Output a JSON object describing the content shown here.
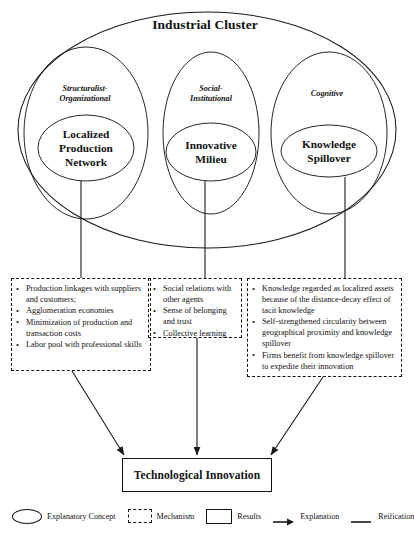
{
  "figure": {
    "cluster_title": "Industrial Cluster"
  },
  "dimensions": [
    {
      "id": "structuralist",
      "label": "Structuralist-\nOrganizational"
    },
    {
      "id": "social",
      "label": "Social-\nInstitutional"
    },
    {
      "id": "cognitive",
      "label": "Cognitive"
    }
  ],
  "concepts": [
    {
      "id": "localized-production-network",
      "label": "Localized\nProduction\nNetwork"
    },
    {
      "id": "innovative-milieu",
      "label": "Innovative\nMilieu"
    },
    {
      "id": "knowledge-spillover",
      "label": "Knowledge\nSpillover"
    }
  ],
  "mechanisms": [
    {
      "id": "structuralist-mechanisms",
      "items": [
        "Production linkages with suppliers and customers;",
        "Agglomeration economies",
        "Minimization of production and transaction costs",
        "Labor pool with professional skills"
      ]
    },
    {
      "id": "social-mechanisms",
      "items": [
        "Social relations with other agents",
        "Sense of belonging and trust",
        "Collective learning"
      ]
    },
    {
      "id": "cognitive-mechanisms",
      "items": [
        "Knowledge regarded as localized assets because of the distance-decay effect of tacit knowledge",
        "Self-strengthened circularity between geographical proximity and knowledge spillover",
        "Firms benefit from knowledge spillover to expedite their innovation"
      ]
    }
  ],
  "results": {
    "label": "Technological Innovation"
  },
  "legend": {
    "items": [
      {
        "id": "explanatory-concept",
        "symbol": "ellipse-outline",
        "label": "Explanatory Concept"
      },
      {
        "id": "mechanism",
        "symbol": "dashed-rectangle",
        "label": "Mechanism"
      },
      {
        "id": "results",
        "symbol": "solid-rectangle",
        "label": "Results"
      },
      {
        "id": "explanation",
        "symbol": "arrow-right",
        "label": "Explanation"
      },
      {
        "id": "reification",
        "symbol": "plain-line",
        "label": "Reification"
      }
    ]
  },
  "colors": {
    "stroke": "#1a1a1a",
    "background": "#ffffff",
    "text": "#111111"
  }
}
